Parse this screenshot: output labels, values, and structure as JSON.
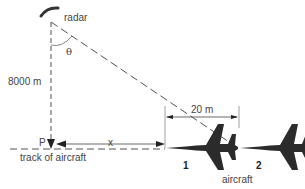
{
  "diagram": {
    "labels": {
      "radar": "radar",
      "height": "8000 m",
      "angle": "θ",
      "point": "P",
      "distance_x": "x",
      "separation": "20 m",
      "track": "track of aircraft",
      "aircraft": "aircraft",
      "aircraft_1": "1",
      "aircraft_2": "2"
    },
    "colors": {
      "line": "#555555",
      "aircraft": "#2b2b2b",
      "text": "#444444"
    }
  }
}
